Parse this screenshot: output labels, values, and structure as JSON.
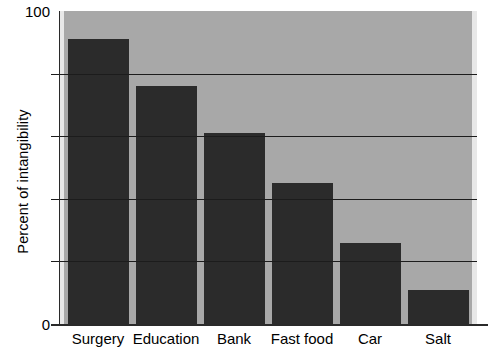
{
  "chart_data": {
    "type": "bar",
    "title": "",
    "xlabel": "",
    "ylabel": "Percent of intangibility",
    "categories": [
      "Surgery",
      "Education",
      "Bank",
      "Fast food",
      "Car",
      "Salt"
    ],
    "values": [
      91,
      76,
      61,
      45,
      26,
      11
    ],
    "ylim": [
      0,
      100
    ],
    "ytick_labels": [
      "100",
      "0"
    ],
    "ytick_values": [
      100,
      0
    ],
    "gridline_values": [
      80,
      60,
      40,
      20
    ],
    "grid": true,
    "legend": "none",
    "bar_color": "#2b2b2b",
    "plot_background": "#a8a8a8",
    "figure_background": "#ffffff",
    "axis_color": "#1c1c1c"
  }
}
